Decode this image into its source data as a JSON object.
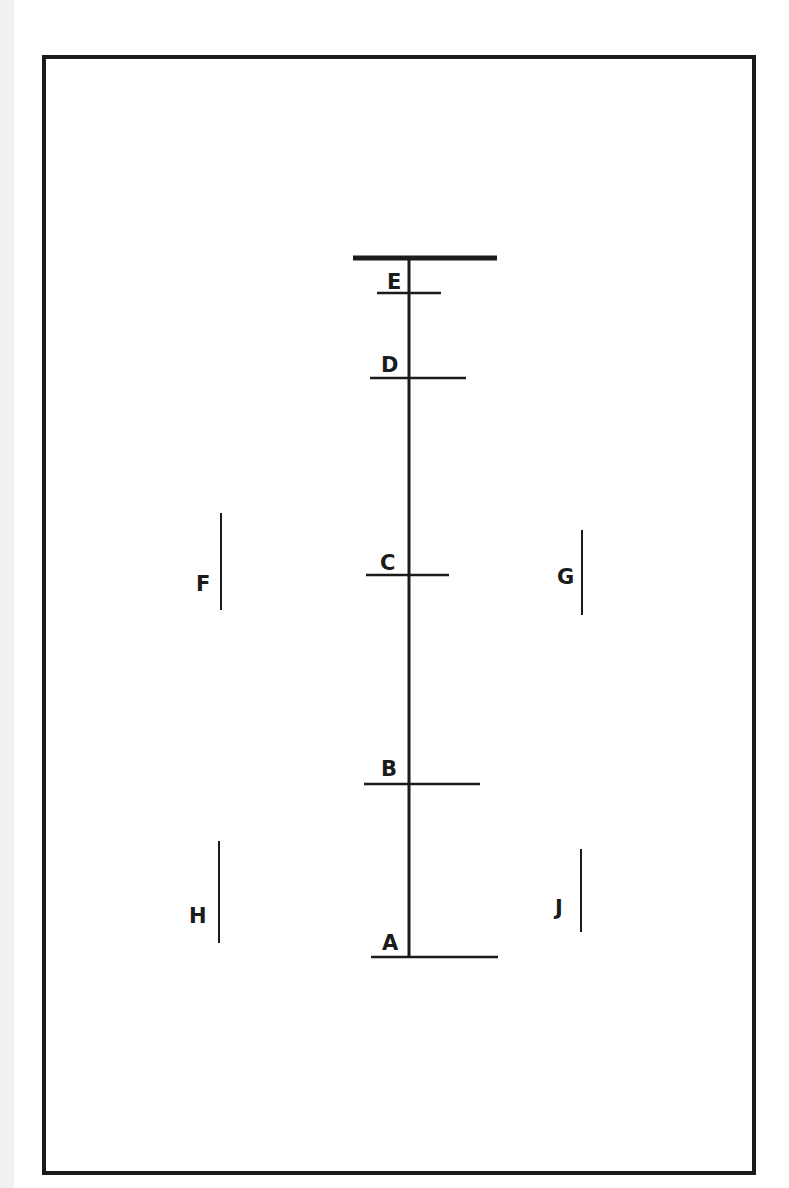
{
  "diagram": {
    "type": "hand-drawn schematic",
    "colors": {
      "ink": "#1b1b1b",
      "paper": "#ffffff"
    },
    "frame": {
      "x": 44,
      "y": 57,
      "width": 710,
      "height": 1116
    },
    "spine": {
      "x": 409,
      "y_top": 258,
      "y_bottom": 957
    },
    "top_bar": {
      "x1": 353,
      "x2": 497,
      "y": 258
    },
    "stations": [
      {
        "label": "E",
        "y": 293,
        "x1": 377,
        "x2": 441,
        "label_x": 387,
        "label_y": 289
      },
      {
        "label": "D",
        "y": 378,
        "x1": 370,
        "x2": 466,
        "label_x": 381,
        "label_y": 372
      },
      {
        "label": "C",
        "y": 575,
        "x1": 366,
        "x2": 449,
        "label_x": 380,
        "label_y": 570
      },
      {
        "label": "B",
        "y": 784,
        "x1": 364,
        "x2": 480,
        "label_x": 381,
        "label_y": 776
      },
      {
        "label": "A",
        "y": 957,
        "x1": 371,
        "x2": 498,
        "label_x": 382,
        "label_y": 950
      }
    ],
    "markers": [
      {
        "label": "F",
        "line_x": 221,
        "y1": 513,
        "y2": 610,
        "label_x": 196,
        "label_y": 591
      },
      {
        "label": "G",
        "line_x": 582,
        "y1": 530,
        "y2": 615,
        "label_x": 557,
        "label_y": 584
      },
      {
        "label": "H",
        "line_x": 219,
        "y1": 841,
        "y2": 943,
        "label_x": 189,
        "label_y": 923
      },
      {
        "label": "J",
        "line_x": 581,
        "y1": 849,
        "y2": 932,
        "label_x": 555,
        "label_y": 915
      }
    ]
  }
}
